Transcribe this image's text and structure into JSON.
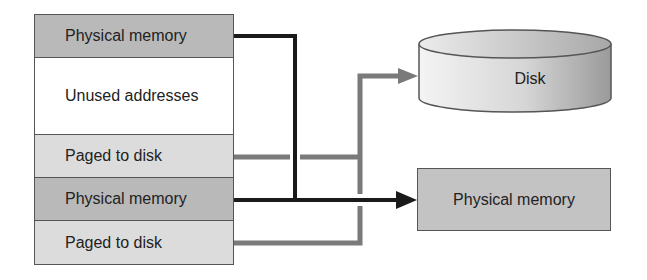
{
  "diagram": {
    "address_space": {
      "rows": [
        {
          "label": "Physical memory",
          "type": "physical",
          "fill": "#b9b9b9"
        },
        {
          "label": "Unused addresses",
          "type": "unused",
          "fill": "#ffffff"
        },
        {
          "label": "Paged to disk",
          "type": "paged",
          "fill": "#dcdcdc"
        },
        {
          "label": "Physical memory",
          "type": "physical",
          "fill": "#b9b9b9"
        },
        {
          "label": "Paged to disk",
          "type": "paged",
          "fill": "#dcdcdc"
        }
      ]
    },
    "targets": {
      "disk": {
        "label": "Disk",
        "shape": "cylinder"
      },
      "physical_memory": {
        "label": "Physical memory",
        "shape": "rectangle",
        "fill": "#c3c3c3"
      }
    },
    "connectors": [
      {
        "from": "row-0",
        "to": "physical_memory",
        "color": "#1a1a1a",
        "style": "thick-black"
      },
      {
        "from": "row-3",
        "to": "physical_memory",
        "color": "#1a1a1a",
        "style": "thick-black"
      },
      {
        "from": "row-2",
        "to": "disk",
        "color": "#7a7a7a",
        "style": "thick-gray"
      },
      {
        "from": "row-4",
        "to": "disk",
        "color": "#7a7a7a",
        "style": "thick-gray"
      }
    ]
  }
}
